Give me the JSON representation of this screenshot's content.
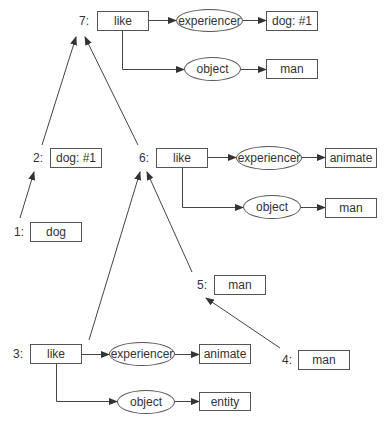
{
  "diagram": {
    "type": "semantic-network-derivation",
    "nodes": {
      "n1": {
        "label": "1:",
        "concept": "dog"
      },
      "n2": {
        "label": "2:",
        "concept": "dog: #1"
      },
      "n3": {
        "label": "3:",
        "concept": "like",
        "experiencer_role": "experiencer",
        "experiencer_value": "animate",
        "object_role": "object",
        "object_value": "entity"
      },
      "n4": {
        "label": "4:",
        "concept": "man"
      },
      "n5": {
        "label": "5:",
        "concept": "man"
      },
      "n6": {
        "label": "6:",
        "concept": "like",
        "experiencer_role": "experiencer",
        "experiencer_value": "animate",
        "object_role": "object",
        "object_value": "man"
      },
      "n7": {
        "label": "7:",
        "concept": "like",
        "experiencer_role": "experiencer",
        "experiencer_value": "dog: #1",
        "object_role": "object",
        "object_value": "man"
      }
    },
    "edges": [
      {
        "from": "1",
        "to": "2"
      },
      {
        "from": "2",
        "to": "7"
      },
      {
        "from": "6",
        "to": "7"
      },
      {
        "from": "3",
        "to": "6"
      },
      {
        "from": "5",
        "to": "6"
      },
      {
        "from": "4",
        "to": "5"
      }
    ]
  }
}
